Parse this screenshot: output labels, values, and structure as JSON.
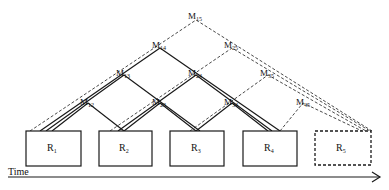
{
  "diagram": {
    "rounds": [
      {
        "id": "R1",
        "base": "R",
        "sub": "1",
        "style": "solid"
      },
      {
        "id": "R2",
        "base": "R",
        "sub": "2",
        "style": "solid"
      },
      {
        "id": "R3",
        "base": "R",
        "sub": "3",
        "style": "solid"
      },
      {
        "id": "R4",
        "base": "R",
        "sub": "4",
        "style": "solid"
      },
      {
        "id": "R5",
        "base": "R",
        "sub": "5",
        "style": "dashed"
      }
    ],
    "merges": [
      {
        "id": "M12",
        "base": "M",
        "sub": "12",
        "style": "solid"
      },
      {
        "id": "M23",
        "base": "M",
        "sub": "23",
        "style": "solid"
      },
      {
        "id": "M34",
        "base": "M",
        "sub": "34",
        "style": "solid"
      },
      {
        "id": "M45",
        "base": "M",
        "sub": "45",
        "style": "dashed"
      },
      {
        "id": "M13",
        "base": "M",
        "sub": "13",
        "style": "solid"
      },
      {
        "id": "M24",
        "base": "M",
        "sub": "24",
        "style": "solid"
      },
      {
        "id": "M35",
        "base": "M",
        "sub": "35",
        "style": "dashed"
      },
      {
        "id": "M14",
        "base": "M",
        "sub": "14",
        "style": "solid"
      },
      {
        "id": "M25",
        "base": "M",
        "sub": "25",
        "style": "dashed"
      },
      {
        "id": "M15",
        "base": "M",
        "sub": "15",
        "style": "dashed"
      }
    ],
    "axis": {
      "label": "Time"
    }
  }
}
